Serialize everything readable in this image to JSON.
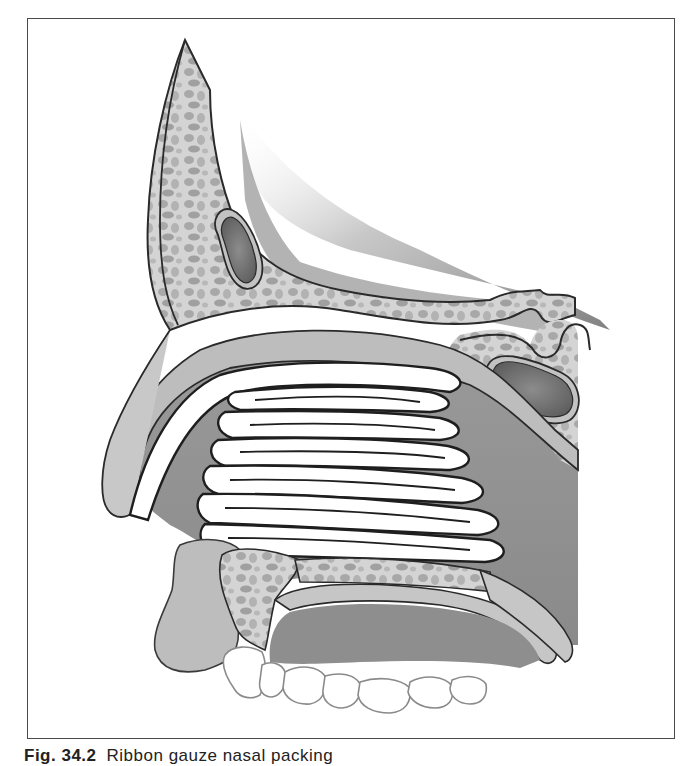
{
  "figure": {
    "colors": {
      "frame": "#4a4a4a",
      "outline": "#2a2a2a",
      "bone_light": "#cfcfcf",
      "bone_cell": "#a9a9a9",
      "mucosa": "#bdbdbd",
      "cavity_dark": "#8f8f8f",
      "sinus_dark": "#6e6e6e",
      "packing": "#ffffff",
      "teeth": "#ffffff"
    },
    "structures": [
      "frontal-bone",
      "frontal-sinus",
      "nasal-bone",
      "sphenoid-sinus",
      "nasal-packing",
      "hard-palate",
      "upper-lip",
      "maxilla",
      "soft-palate",
      "upper-teeth"
    ]
  },
  "caption": {
    "label": "Fig. 34.2",
    "text": "Ribbon gauze nasal packing"
  }
}
